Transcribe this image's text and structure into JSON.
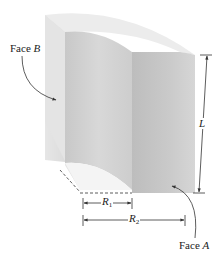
{
  "figure": {
    "labels": {
      "face_b": {
        "text": "Face ",
        "var": "B"
      },
      "face_a": {
        "text": "Face ",
        "var": "A"
      },
      "length": "L",
      "r1": {
        "var": "R",
        "sub": "1"
      },
      "r2": {
        "var": "R",
        "sub": "2"
      }
    },
    "colors": {
      "top_surface": "#ebebeb",
      "left_face": "#e2e2e2",
      "inner_face": "#cfcfcf",
      "front_face": "#c4c4c4",
      "line": "#333333"
    }
  }
}
